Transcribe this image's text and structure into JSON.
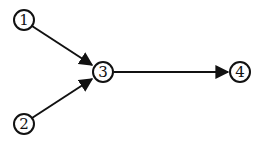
{
  "diagram": {
    "type": "directed-graph",
    "nodes": [
      {
        "id": "1",
        "label": "1",
        "x": 24,
        "y": 20
      },
      {
        "id": "2",
        "label": "2",
        "x": 24,
        "y": 124
      },
      {
        "id": "3",
        "label": "3",
        "x": 103,
        "y": 72
      },
      {
        "id": "4",
        "label": "4",
        "x": 240,
        "y": 72
      }
    ],
    "edges": [
      {
        "from": "1",
        "to": "3"
      },
      {
        "from": "2",
        "to": "3"
      },
      {
        "from": "3",
        "to": "4"
      }
    ],
    "colors": {
      "stroke": "#111111",
      "background": "#ffffff"
    }
  }
}
